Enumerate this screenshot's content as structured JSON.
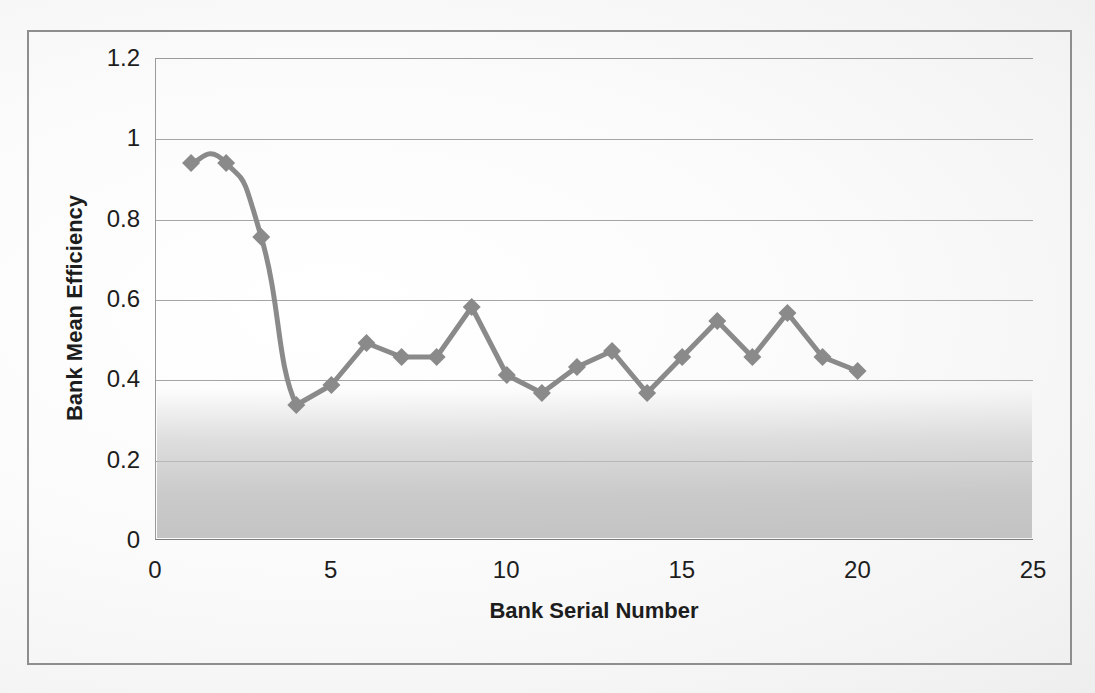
{
  "chart_data": {
    "type": "line",
    "title": "",
    "xlabel": "Bank Serial Number",
    "ylabel": "Bank Mean Efficiency",
    "xlim": [
      0,
      25
    ],
    "ylim": [
      0,
      1.2
    ],
    "xticks": [
      "0",
      "5",
      "10",
      "15",
      "20",
      "25"
    ],
    "xtick_values": [
      0,
      5,
      10,
      15,
      20,
      25
    ],
    "yticks": [
      "0",
      "0.2",
      "0.4",
      "0.6",
      "0.8",
      "1",
      "1.2"
    ],
    "ytick_values": [
      0,
      0.2,
      0.4,
      0.6,
      0.8,
      1,
      1.2
    ],
    "grid": "horizontal",
    "legend": "none",
    "marker": "diamond",
    "series_color": "#8a8a8a",
    "x": [
      1,
      2,
      3,
      4,
      5,
      6,
      7,
      8,
      9,
      10,
      11,
      12,
      13,
      14,
      15,
      16,
      17,
      18,
      19,
      20
    ],
    "values": [
      0.94,
      0.94,
      0.755,
      0.335,
      0.385,
      0.49,
      0.455,
      0.455,
      0.58,
      0.41,
      0.365,
      0.43,
      0.47,
      0.365,
      0.455,
      0.545,
      0.455,
      0.565,
      0.455,
      0.42
    ],
    "series": [
      {
        "name": "Bank Mean Efficiency",
        "values": [
          0.94,
          0.94,
          0.755,
          0.335,
          0.385,
          0.49,
          0.455,
          0.455,
          0.58,
          0.41,
          0.365,
          0.43,
          0.47,
          0.365,
          0.455,
          0.545,
          0.455,
          0.565,
          0.455,
          0.42
        ]
      }
    ]
  },
  "figure": {
    "border_color": "#8e8e8e",
    "grid_color": "#a5a5a5",
    "axis_color": "#7d7d7d",
    "text_color": "#1d1d1d",
    "background": "#ffffff"
  }
}
